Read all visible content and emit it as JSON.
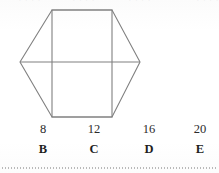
{
  "figure": {
    "name": "hexagon-with-inscribed-rectangle",
    "stroke_color": "#808080",
    "stroke_width": 1,
    "hexagon_points": "20,62 52,10 112,10 140,62 112,117 52,117",
    "rectangle_points": "52,10 112,10 112,117 52,117",
    "horizontal_diagonal": {
      "x1": 20,
      "y1": 62,
      "x2": 140,
      "y2": 62
    }
  },
  "clipped_text_above": "· ·  ·  ·",
  "answers": {
    "numbers": [
      "8",
      "12",
      "16",
      "20"
    ],
    "letters": [
      "B",
      "C",
      "D",
      "E"
    ]
  },
  "rule": {
    "style": "dotted",
    "color": "#b9b9b9"
  }
}
